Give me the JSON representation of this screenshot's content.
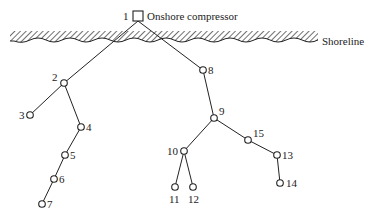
{
  "diagram": {
    "type": "pipeline-network-tree",
    "compressor": {
      "id": "1",
      "label": "Onshore compressor",
      "x": 138,
      "y": 16
    },
    "shoreline": {
      "label": "Shoreline"
    },
    "nodes": [
      {
        "id": "2",
        "x": 64,
        "y": 83,
        "label_dx": -12,
        "label_dy": -2
      },
      {
        "id": "3",
        "x": 30,
        "y": 115,
        "label_dx": -11,
        "label_dy": 4
      },
      {
        "id": "4",
        "x": 81,
        "y": 127,
        "label_dx": 5,
        "label_dy": 4
      },
      {
        "id": "5",
        "x": 65,
        "y": 155,
        "label_dx": 5,
        "label_dy": 4
      },
      {
        "id": "6",
        "x": 54,
        "y": 179,
        "label_dx": 5,
        "label_dy": 4
      },
      {
        "id": "7",
        "x": 42,
        "y": 204,
        "label_dx": 5,
        "label_dy": 4
      },
      {
        "id": "8",
        "x": 203,
        "y": 70,
        "label_dx": 5,
        "label_dy": 4
      },
      {
        "id": "9",
        "x": 214,
        "y": 118,
        "label_dx": 5,
        "label_dy": -3
      },
      {
        "id": "10",
        "x": 184,
        "y": 151,
        "label_dx": -17,
        "label_dy": 4
      },
      {
        "id": "11",
        "x": 175,
        "y": 187,
        "label_dx": -6,
        "label_dy": 16
      },
      {
        "id": "12",
        "x": 193,
        "y": 187,
        "label_dx": -5,
        "label_dy": 16
      },
      {
        "id": "13",
        "x": 277,
        "y": 155,
        "label_dx": 5,
        "label_dy": 4
      },
      {
        "id": "14",
        "x": 280,
        "y": 183,
        "label_dx": 6,
        "label_dy": 4
      },
      {
        "id": "15",
        "x": 248,
        "y": 140,
        "label_dx": 5,
        "label_dy": -3
      }
    ],
    "edges": [
      [
        "1",
        "2"
      ],
      [
        "2",
        "3"
      ],
      [
        "2",
        "4"
      ],
      [
        "4",
        "5"
      ],
      [
        "5",
        "6"
      ],
      [
        "6",
        "7"
      ],
      [
        "1",
        "8"
      ],
      [
        "8",
        "9"
      ],
      [
        "9",
        "10"
      ],
      [
        "10",
        "11"
      ],
      [
        "10",
        "12"
      ],
      [
        "9",
        "15"
      ],
      [
        "15",
        "13"
      ],
      [
        "13",
        "14"
      ]
    ]
  }
}
